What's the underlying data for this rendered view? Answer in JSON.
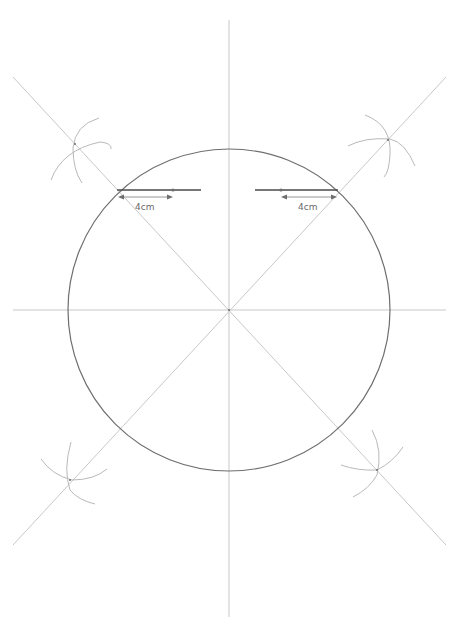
{
  "diagram": {
    "center": [
      229,
      310
    ],
    "radius": 161,
    "colors": {
      "background": "#ffffff",
      "guide_lines": "#c8c8c8",
      "circle": "#6e6e6e",
      "chord": "#4a4a4a",
      "label": "#6a6a6a"
    },
    "lines": {
      "vertical": {
        "x1": 229,
        "y1": 20,
        "x2": 229,
        "y2": 617
      },
      "horizontal": {
        "x1": 13,
        "y1": 310,
        "x2": 446,
        "y2": 310
      },
      "diagonal_a": {
        "x1": 13,
        "y1": 77,
        "x2": 446,
        "y2": 545
      },
      "diagonal_b": {
        "x1": 446,
        "y1": 77,
        "x2": 13,
        "y2": 545
      }
    },
    "measurements": [
      {
        "label": "4cm",
        "side": "left"
      },
      {
        "label": "4cm",
        "side": "right"
      }
    ]
  }
}
